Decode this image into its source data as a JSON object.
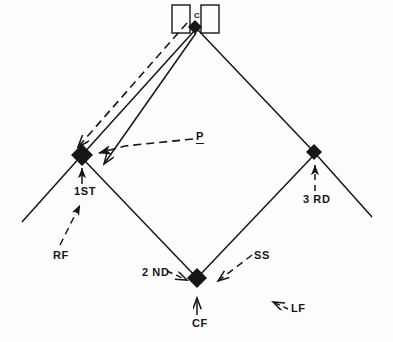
{
  "diagram": {
    "type": "baseball-field-schematic",
    "background_color": "#fdfdfd",
    "ink_color": "#161616"
  },
  "labels": {
    "catcher": "C",
    "pitcher": "P",
    "first_base": "1ST",
    "second_base": "2 ND",
    "third_base": "3 RD",
    "shortstop": "SS",
    "right_field": "RF",
    "center_field": "CF",
    "left_field": "LF"
  },
  "bases": [
    {
      "name": "home-plate",
      "x": 195,
      "y": 27,
      "size": 7,
      "filled": true
    },
    {
      "name": "first-base",
      "x": 82,
      "y": 155,
      "size": 11,
      "filled": true
    },
    {
      "name": "second-base",
      "x": 197,
      "y": 278,
      "size": 10,
      "filled": true
    },
    {
      "name": "third-base",
      "x": 314,
      "y": 152,
      "size": 8,
      "filled": true
    }
  ],
  "batter_boxes": [
    {
      "name": "batter-box-left",
      "x": 172,
      "y": 5,
      "w": 18,
      "h": 28
    },
    {
      "name": "batter-box-right",
      "x": 201,
      "y": 5,
      "w": 18,
      "h": 28
    }
  ],
  "solid_lines": [
    {
      "name": "foul-line-right",
      "points": "195,30 82,155 22,222"
    },
    {
      "name": "foul-line-left",
      "points": "197,30 314,152 372,217"
    },
    {
      "name": "baseline-first-second",
      "points": "82,158 197,278"
    },
    {
      "name": "baseline-second-third",
      "points": "197,278 314,155"
    },
    {
      "name": "home-to-cutoff",
      "points": "195,32 101,167"
    }
  ],
  "dashed_lines": [
    {
      "name": "catcher-throw-to-first",
      "points": "186,22 76,148"
    },
    {
      "name": "pitcher-pointer",
      "points": "194,140 121,147 96,155"
    },
    {
      "name": "rightfield-pointer",
      "points": "61,246 79,206"
    },
    {
      "name": "thirdbase-pointer",
      "points": "318,192 318,164"
    },
    {
      "name": "secondbase-pointer",
      "points": "166,272 188,280"
    },
    {
      "name": "shortstop-pointer",
      "points": "252,256 218,281"
    },
    {
      "name": "centerfield-pointer",
      "points": "197,314 197,296"
    },
    {
      "name": "leftfield-pointer",
      "points": "289,308 274,302"
    },
    {
      "name": "firstbase-pointer",
      "points": "82,207 82,170"
    }
  ]
}
